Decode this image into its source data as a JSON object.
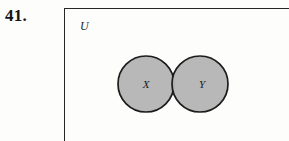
{
  "figure": {
    "exercise_number": "41.",
    "universe_label": "U",
    "set_labels": {
      "left": "X",
      "right": "Y"
    },
    "colors": {
      "shading": "#b4b4b4",
      "outline": "#1c1c1c",
      "rect_border": "#262626",
      "background": "#fdfdfc",
      "text": "#141414"
    },
    "geometry": {
      "rect_left": 64,
      "rect_top": 8,
      "circle_radius": 28,
      "left_circle_cx": 146,
      "right_circle_cx": 200,
      "circle_cy": 84
    }
  }
}
